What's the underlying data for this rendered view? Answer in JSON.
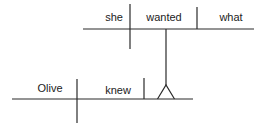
{
  "diagram": {
    "type": "sentence-diagram",
    "main_clause": {
      "subject": "Olive",
      "verb": "knew"
    },
    "object_clause": {
      "subject": "she",
      "verb": "wanted",
      "object": "what"
    }
  },
  "colors": {
    "line": "#2a2a2a",
    "text": "#222222",
    "background": "#ffffff"
  }
}
